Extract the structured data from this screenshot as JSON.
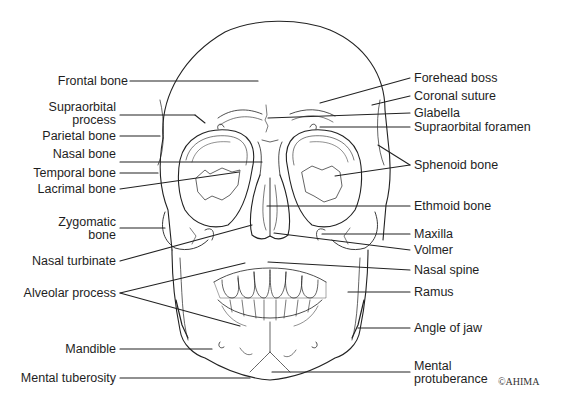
{
  "diagram": {
    "copyright": "©AHIMA",
    "left_labels": [
      {
        "id": "frontal-bone",
        "text": "Frontal bone"
      },
      {
        "id": "supraorbital-process-1",
        "text": "Supraorbital"
      },
      {
        "id": "supraorbital-process-2",
        "text": "process"
      },
      {
        "id": "parietal-bone",
        "text": "Parietal bone"
      },
      {
        "id": "nasal-bone",
        "text": "Nasal bone"
      },
      {
        "id": "temporal-bone",
        "text": "Temporal bone"
      },
      {
        "id": "lacrimal-bone",
        "text": "Lacrimal bone"
      },
      {
        "id": "zygomatic-bone-1",
        "text": "Zygomatic"
      },
      {
        "id": "zygomatic-bone-2",
        "text": "bone"
      },
      {
        "id": "nasal-turbinate",
        "text": "Nasal turbinate"
      },
      {
        "id": "alveolar-process",
        "text": "Alveolar process"
      },
      {
        "id": "mandible",
        "text": "Mandible"
      },
      {
        "id": "mental-tuberosity",
        "text": "Mental tuberosity"
      }
    ],
    "right_labels": [
      {
        "id": "forehead-boss",
        "text": "Forehead boss"
      },
      {
        "id": "coronal-suture",
        "text": "Coronal suture"
      },
      {
        "id": "glabella",
        "text": "Glabella"
      },
      {
        "id": "supraorbital-foramen",
        "text": "Supraorbital foramen"
      },
      {
        "id": "sphenoid-bone",
        "text": "Sphenoid bone"
      },
      {
        "id": "ethmoid-bone",
        "text": "Ethmoid bone"
      },
      {
        "id": "maxilla",
        "text": "Maxilla"
      },
      {
        "id": "volmer",
        "text": "Volmer"
      },
      {
        "id": "nasal-spine",
        "text": "Nasal spine"
      },
      {
        "id": "ramus",
        "text": "Ramus"
      },
      {
        "id": "angle-of-jaw",
        "text": "Angle of jaw"
      },
      {
        "id": "mental-protuberance-1",
        "text": "Mental"
      },
      {
        "id": "mental-protuberance-2",
        "text": "protuberance"
      }
    ]
  }
}
